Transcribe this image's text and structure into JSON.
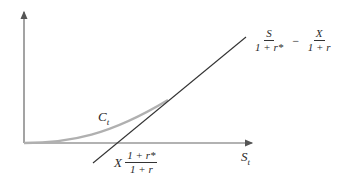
{
  "diagram": {
    "type": "option-value-vs-spot",
    "curve_label": {
      "main": "C",
      "sub": "t"
    },
    "x_axis_label": {
      "main": "S",
      "sub": "t"
    },
    "asymptote_label": {
      "term1": {
        "num": "S",
        "den": "1 + r*"
      },
      "operator": "−",
      "term2": {
        "num": "X",
        "den": "1 + r"
      }
    },
    "intercept_label": {
      "prefix": "X",
      "num": "1 + r*",
      "den": "1 + r"
    },
    "colors": {
      "axis": "#555555",
      "line": "#333333",
      "curve": "#aaaaaa"
    }
  }
}
